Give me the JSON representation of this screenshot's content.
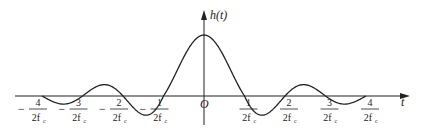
{
  "chart_data": {
    "type": "line",
    "title": "",
    "ylabel": "h(t)",
    "xlabel": "t",
    "origin_label": "O",
    "function": "sinc-shaped impulse response h(t), main lobe at t=0, zeros at t = k/(2f_c)",
    "x_ticks": [
      {
        "sign": "−",
        "num": "4",
        "den": "2f",
        "sub": "c",
        "value": -4
      },
      {
        "sign": "−",
        "num": "3",
        "den": "2f",
        "sub": "c",
        "value": -3
      },
      {
        "sign": "−",
        "num": "2",
        "den": "2f",
        "sub": "c",
        "value": -2
      },
      {
        "sign": "−",
        "num": "1",
        "den": "2f",
        "sub": "c",
        "value": -1
      },
      {
        "sign": "",
        "num": "1",
        "den": "2f",
        "sub": "c",
        "value": 1
      },
      {
        "sign": "",
        "num": "2",
        "den": "2f",
        "sub": "c",
        "value": 2
      },
      {
        "sign": "",
        "num": "3",
        "den": "2f",
        "sub": "c",
        "value": 3
      },
      {
        "sign": "",
        "num": "4",
        "den": "2f",
        "sub": "c",
        "value": 4
      }
    ],
    "x_range": [
      -4,
      4
    ],
    "grid": false,
    "legend": "none"
  },
  "labels": {
    "y_axis": "h(t)",
    "x_axis": "t",
    "origin": "O"
  },
  "colors": {
    "line": "#222222",
    "background": "#ffffff"
  }
}
